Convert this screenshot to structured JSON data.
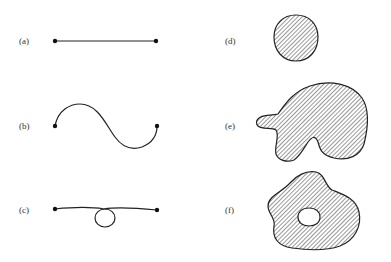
{
  "figure": {
    "panels": [
      {
        "id": "a",
        "label": "(a)",
        "description": "simple arc (straight segment with endpoints)"
      },
      {
        "id": "b",
        "label": "(b)",
        "description": "simple arc (S-shaped curve with endpoints)"
      },
      {
        "id": "c",
        "label": "(c)",
        "description": "arc with self-intersecting loop"
      },
      {
        "id": "d",
        "label": "(d)",
        "description": "hatched disk-like region"
      },
      {
        "id": "e",
        "label": "(e)",
        "description": "hatched irregular simply connected region"
      },
      {
        "id": "f",
        "label": "(f)",
        "description": "hatched irregular region with a hole"
      }
    ],
    "colors": {
      "ink": "#222222",
      "background": "#ffffff"
    }
  }
}
